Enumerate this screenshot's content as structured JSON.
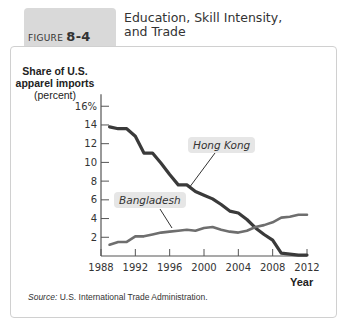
{
  "figure": {
    "label": "FIGURE",
    "number": "8-4",
    "title_line1": "Education, Skill Intensity,",
    "title_line2": "and Trade"
  },
  "axis": {
    "ylabel_line1": "Share of U.S.",
    "ylabel_line2": "apparel imports",
    "ylabel_line3": "(percent)",
    "xlabel": "Year"
  },
  "source": {
    "prefix": "Source:",
    "text": " U.S. International Trade Administration."
  },
  "callouts": {
    "hong_kong": "Hong Kong",
    "bangladesh": "Bangladesh"
  },
  "colors": {
    "hong_kong": "#3a3a3a",
    "bangladesh": "#6e6e6e",
    "tab": "#d9d9d9",
    "callout_bg": "#e6e6e6"
  },
  "chart_data": {
    "type": "line",
    "title": "Education, Skill Intensity, and Trade",
    "xlabel": "Year",
    "ylabel": "Share of U.S. apparel imports (percent)",
    "x_ticks": [
      1988,
      1992,
      1996,
      2000,
      2004,
      2008,
      2012
    ],
    "y_ticks": [
      2,
      4,
      6,
      8,
      10,
      12,
      14,
      16
    ],
    "y_tick_labels": [
      "2",
      "4",
      "6",
      "8",
      "10",
      "12",
      "14",
      "16%"
    ],
    "ylim": [
      0,
      16
    ],
    "xlim": [
      1988,
      2012
    ],
    "grid": false,
    "x": [
      1989,
      1990,
      1991,
      1992,
      1993,
      1994,
      1995,
      1996,
      1997,
      1998,
      1999,
      2000,
      2001,
      2002,
      2003,
      2004,
      2005,
      2006,
      2007,
      2008,
      2009,
      2010,
      2011,
      2012
    ],
    "series": [
      {
        "name": "Hong Kong",
        "values": [
          13.8,
          13.6,
          13.6,
          12.8,
          11.0,
          11.0,
          9.9,
          8.7,
          7.6,
          7.6,
          6.9,
          6.5,
          6.1,
          5.5,
          4.8,
          4.6,
          3.9,
          3.0,
          2.3,
          1.7,
          0.3,
          0.2,
          0.1,
          0.1
        ]
      },
      {
        "name": "Bangladesh",
        "values": [
          1.2,
          1.5,
          1.5,
          2.1,
          2.1,
          2.3,
          2.5,
          2.6,
          2.7,
          2.8,
          2.7,
          3.0,
          3.1,
          2.8,
          2.6,
          2.5,
          2.7,
          3.1,
          3.3,
          3.6,
          4.1,
          4.2,
          4.4,
          4.4
        ]
      }
    ],
    "annotations": [
      "Hong Kong",
      "Bangladesh"
    ],
    "source": "U.S. International Trade Administration."
  }
}
